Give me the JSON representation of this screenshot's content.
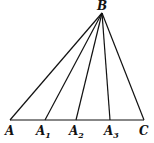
{
  "diagram": {
    "points": {
      "B": {
        "label": "B",
        "x": 102,
        "y": 13
      },
      "A": {
        "label": "A",
        "x": 10,
        "y": 120
      },
      "A1": {
        "label": "A",
        "sub": "1",
        "x": 45,
        "y": 120
      },
      "A2": {
        "label": "A",
        "sub": "2",
        "x": 76,
        "y": 120
      },
      "A3": {
        "label": "A",
        "sub": "3",
        "x": 110,
        "y": 120
      },
      "C": {
        "label": "C",
        "x": 144,
        "y": 120
      }
    },
    "segments": [
      "BA",
      "BA1",
      "BA2",
      "BA3",
      "BC",
      "AC"
    ],
    "line_color": "#111111"
  }
}
